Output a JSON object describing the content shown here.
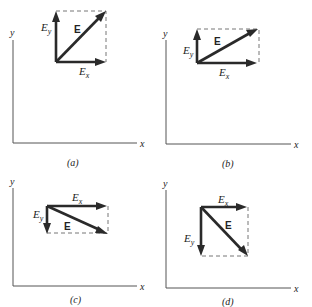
{
  "figure": {
    "axis_labels": {
      "x": "x",
      "y": "y"
    },
    "vector_label": "E",
    "component_labels": {
      "x_base": "E",
      "x_sub": "x",
      "y_base": "E",
      "y_sub": "y"
    },
    "panels": [
      {
        "id": "a",
        "caption": "(a)",
        "ex_direction": "+x",
        "ey_direction": "+y",
        "aspect": "square"
      },
      {
        "id": "b",
        "caption": "(b)",
        "ex_direction": "+x",
        "ey_direction": "+y",
        "aspect": "wide-short"
      },
      {
        "id": "c",
        "caption": "(c)",
        "ex_direction": "+x",
        "ey_direction": "-y",
        "aspect": "wide-short"
      },
      {
        "id": "d",
        "caption": "(d)",
        "ex_direction": "+x",
        "ey_direction": "-y",
        "aspect": "square"
      }
    ]
  },
  "colors": {
    "vector": "#2a2a2a",
    "axis": "#555555",
    "dashed": "#777777",
    "text": "#222222"
  }
}
